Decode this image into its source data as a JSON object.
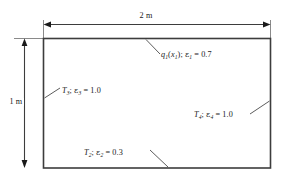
{
  "figure": {
    "type": "enclosure-cross-section-diagram",
    "line_color": "#3d3d3d",
    "text_color": "#1a1a1a",
    "background": "#ffffff"
  },
  "dimensions": {
    "width_label": "2 m",
    "height_label": "1 m"
  },
  "surfaces": {
    "top": {
      "flux_symbol": "q",
      "flux_index": "1",
      "flux_arg_symbol": "x",
      "flux_arg_index": "1",
      "emissivity_symbol": "ε",
      "emissivity_index": "1",
      "emissivity_value": "0.7",
      "sep": "; ",
      "eq": " = ",
      "open": "(",
      "close": ")"
    },
    "left": {
      "temperature_symbol": "T",
      "temperature_index": "3",
      "emissivity_symbol": "ε",
      "emissivity_index": "3",
      "emissivity_value": "1.0",
      "sep": "; ",
      "eq": " = "
    },
    "right": {
      "temperature_symbol": "T",
      "temperature_index": "4",
      "emissivity_symbol": "ε",
      "emissivity_index": "4",
      "emissivity_value": "1.0",
      "sep": "; ",
      "eq": " = "
    },
    "bottom": {
      "temperature_symbol": "T",
      "temperature_index": "2",
      "emissivity_symbol": "ε",
      "emissivity_index": "2",
      "emissivity_value": "0.3",
      "sep": "; ",
      "eq": " = "
    }
  }
}
